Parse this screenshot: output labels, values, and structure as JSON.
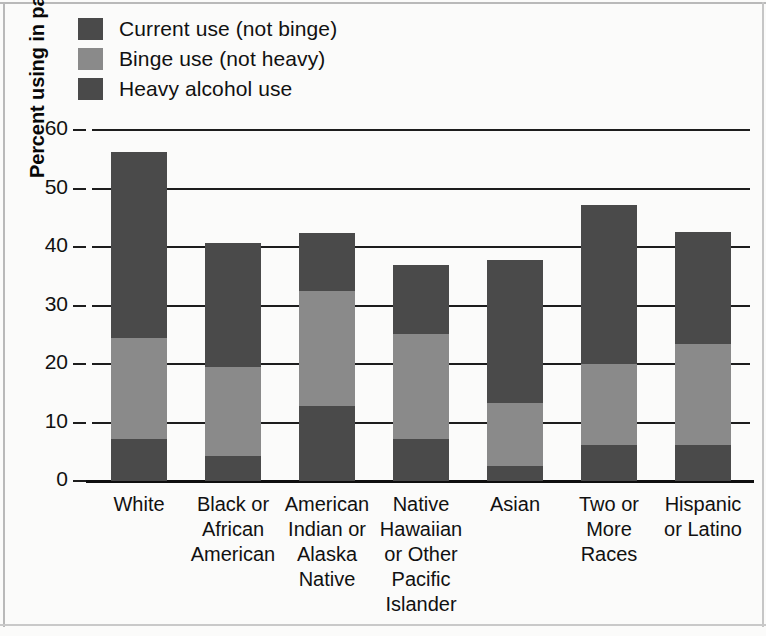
{
  "chart_data": {
    "type": "bar",
    "stacked": true,
    "title": "",
    "subtitle": "",
    "xlabel": "",
    "ylabel": "Percent using in past month",
    "ylim": [
      0,
      60
    ],
    "ytick_values": [
      60,
      50,
      40,
      30,
      20,
      10,
      0
    ],
    "ytick_labels": [
      "60",
      "50",
      "40",
      "30",
      "20",
      "10",
      "0"
    ],
    "grid": true,
    "legend_position": "top-left",
    "categories": [
      "White",
      "Black or African American",
      "American Indian or Alaska Native",
      "Native Hawaiian or Other Pacific Islander",
      "Asian",
      "Two or More Races",
      "Hispanic or Latino"
    ],
    "series": [
      {
        "name": "Heavy alcohol use",
        "color": "#4a4a4a",
        "values": [
          7.2,
          4.3,
          12.9,
          7.1,
          2.6,
          6.1,
          6.2
        ]
      },
      {
        "name": "Binge use (not heavy)",
        "color": "#8a8a8a",
        "values": [
          17.3,
          15.2,
          19.6,
          18.0,
          10.7,
          13.9,
          17.3
        ]
      },
      {
        "name": "Current use (not binge)",
        "color": "#4a4a4a",
        "values": [
          31.8,
          21.2,
          9.9,
          11.9,
          24.4,
          27.2,
          19.0
        ]
      }
    ],
    "totals": [
      56.3,
      40.7,
      42.4,
      37.0,
      37.7,
      47.2,
      42.5
    ],
    "cumulative_boundaries": [
      [
        7.2,
        24.5,
        56.3
      ],
      [
        4.3,
        19.5,
        40.7
      ],
      [
        12.9,
        32.5,
        42.4
      ],
      [
        7.1,
        25.1,
        37.0
      ],
      [
        2.6,
        13.3,
        37.7
      ],
      [
        6.1,
        20.0,
        47.2
      ],
      [
        6.2,
        23.5,
        42.5
      ]
    ]
  },
  "legend": {
    "items": [
      {
        "label": "Current use (not binge)",
        "color": "#4a4a4a"
      },
      {
        "label": "Binge use (not heavy)",
        "color": "#8a8a8a"
      },
      {
        "label": "Heavy alcohol use",
        "color": "#4a4a4a"
      }
    ]
  },
  "axis": {
    "y_title": "Percent using in past month",
    "y_ticks": [
      "60",
      "50",
      "40",
      "30",
      "20",
      "10",
      "0"
    ]
  },
  "x_category_lines": [
    [
      "White"
    ],
    [
      "Black or",
      "African",
      "American"
    ],
    [
      "American",
      "Indian or",
      "Alaska",
      "Native"
    ],
    [
      "Native",
      "Hawaiian",
      "or Other",
      "Pacific",
      "Islander"
    ],
    [
      "Asian"
    ],
    [
      "Two or",
      "More",
      "Races"
    ],
    [
      "Hispanic",
      "or Latino"
    ]
  ]
}
